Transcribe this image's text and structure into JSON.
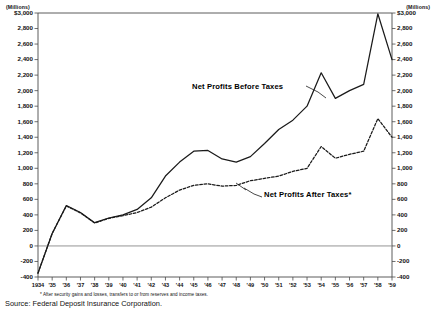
{
  "chart_data": {
    "type": "line",
    "title": "",
    "unit_label_left": "(Millions)",
    "unit_label_right": "(Millions)",
    "xlabel": "",
    "ylabel": "",
    "ylim": [
      -400,
      3000
    ],
    "ytick_step": 200,
    "grid": false,
    "legend_position": "inline-annotation",
    "yticks": [
      "$3,000",
      "2,800",
      "2,600",
      "2,400",
      "2,200",
      "2,000",
      "1,800",
      "1,600",
      "1,400",
      "1,200",
      "1,000",
      "800",
      "600",
      "400",
      "200",
      "0",
      "-200",
      "-400"
    ],
    "yticks_right": [
      "$3,000",
      "2,800",
      "2,600",
      "2,400",
      "2,200",
      "2,000",
      "1,800",
      "1,600",
      "1,400",
      "1,200",
      "1,000",
      "800",
      "600",
      "400",
      "200",
      "0",
      "-200",
      "-400"
    ],
    "ytick_values": [
      3000,
      2800,
      2600,
      2400,
      2200,
      2000,
      1800,
      1600,
      1400,
      1200,
      1000,
      800,
      600,
      400,
      200,
      0,
      -200,
      -400
    ],
    "categories": [
      "1934",
      "'35",
      "'36",
      "'37",
      "'38",
      "'39",
      "'40",
      "'41",
      "'42",
      "'43",
      "'44",
      "'45",
      "'46",
      "'47",
      "'48",
      "'49",
      "'50",
      "'51",
      "'52",
      "'53",
      "'54",
      "'55",
      "'56",
      "'57",
      "'58",
      "'59"
    ],
    "x": [
      1934,
      1935,
      1936,
      1937,
      1938,
      1939,
      1940,
      1941,
      1942,
      1943,
      1944,
      1945,
      1946,
      1947,
      1948,
      1949,
      1950,
      1951,
      1952,
      1953,
      1954,
      1955,
      1956,
      1957,
      1958,
      1959
    ],
    "series": [
      {
        "name": "Net Profits Before Taxes",
        "style": "solid",
        "color": "#1a1a1a",
        "values": [
          -350,
          160,
          520,
          430,
          300,
          360,
          400,
          470,
          620,
          900,
          1080,
          1220,
          1230,
          1120,
          1080,
          1150,
          1320,
          1500,
          1620,
          1800,
          2230,
          1900,
          2000,
          2080,
          2990,
          2400
        ]
      },
      {
        "name": "Net Profits After Taxes*",
        "style": "dashed",
        "color": "#1a1a1a",
        "values": [
          -350,
          160,
          515,
          425,
          295,
          355,
          390,
          430,
          500,
          620,
          720,
          780,
          800,
          770,
          780,
          840,
          870,
          900,
          960,
          1000,
          1280,
          1130,
          1180,
          1220,
          1640,
          1400
        ]
      }
    ],
    "annotations": [
      {
        "name": "label-before-taxes",
        "text": "Net Profits Before Taxes"
      },
      {
        "name": "label-after-taxes",
        "text": "Net Profits After Taxes*"
      }
    ]
  },
  "footnote": {
    "text": "* After security gains and losses, transfers to or from reserves and income taxes."
  },
  "source": {
    "text": "Source: Federal Deposit Insurance Corporation."
  },
  "colors": {
    "line": "#1a1a1a",
    "axis": "#4a4a4a",
    "zero_line": "#7a7a7a",
    "background": "#ffffff"
  }
}
